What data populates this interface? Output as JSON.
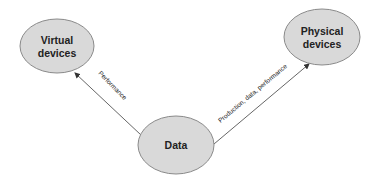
{
  "diagram": {
    "colors": {
      "node_fill": "#d9d9d9",
      "node_stroke": "#8a8a8a",
      "edge": "#555555",
      "text": "#222222"
    },
    "nodes": [
      {
        "id": "virtual",
        "label_line1": "Virtual",
        "label_line2": "devices",
        "cx": 57,
        "cy": 46,
        "rx": 37,
        "ry": 27
      },
      {
        "id": "physical",
        "label_line1": "Physical",
        "label_line2": "devices",
        "cx": 322,
        "cy": 37,
        "rx": 38,
        "ry": 28
      },
      {
        "id": "data",
        "label_line1": "Data",
        "cx": 176,
        "cy": 145,
        "rx": 38,
        "ry": 29
      }
    ],
    "edges": [
      {
        "from": "data",
        "to": "virtual",
        "label": "Performance"
      },
      {
        "from": "data",
        "to": "physical",
        "label": "Production, data, performance"
      }
    ]
  }
}
